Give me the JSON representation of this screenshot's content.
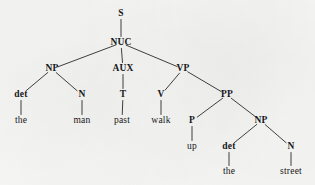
{
  "diagram": {
    "type": "constituency-syntax-tree",
    "sentence": "the man past walk up the street",
    "background_color": "#f6f6f4",
    "ink_color": "#16161a",
    "nodes": [
      {
        "id": "S",
        "label": "S",
        "kind": "category",
        "x": 121,
        "y": 14
      },
      {
        "id": "NUC",
        "label": "NUC",
        "kind": "category",
        "x": 121,
        "y": 43
      },
      {
        "id": "NP1",
        "label": "NP",
        "kind": "category",
        "x": 52,
        "y": 69
      },
      {
        "id": "AUX",
        "label": "AUX",
        "kind": "category",
        "x": 123,
        "y": 69
      },
      {
        "id": "VP",
        "label": "VP",
        "kind": "category",
        "x": 183,
        "y": 69
      },
      {
        "id": "det1",
        "label": "det",
        "kind": "category",
        "x": 21,
        "y": 95
      },
      {
        "id": "N1",
        "label": "N",
        "kind": "category",
        "x": 82,
        "y": 95
      },
      {
        "id": "T",
        "label": "T",
        "kind": "category",
        "x": 123,
        "y": 95
      },
      {
        "id": "V",
        "label": "V",
        "kind": "category",
        "x": 161,
        "y": 95
      },
      {
        "id": "PP",
        "label": "PP",
        "kind": "category",
        "x": 227,
        "y": 95
      },
      {
        "id": "the1",
        "label": "the",
        "kind": "word",
        "x": 21,
        "y": 121
      },
      {
        "id": "man",
        "label": "man",
        "kind": "word",
        "x": 82,
        "y": 121
      },
      {
        "id": "past",
        "label": "past",
        "kind": "word",
        "x": 122,
        "y": 121
      },
      {
        "id": "walk",
        "label": "walk",
        "kind": "word",
        "x": 161,
        "y": 121
      },
      {
        "id": "P",
        "label": "P",
        "kind": "category",
        "x": 192,
        "y": 121
      },
      {
        "id": "NP2",
        "label": "NP",
        "kind": "category",
        "x": 261,
        "y": 121
      },
      {
        "id": "up",
        "label": "up",
        "kind": "word",
        "x": 192,
        "y": 147
      },
      {
        "id": "det2",
        "label": "det",
        "kind": "category",
        "x": 229,
        "y": 147
      },
      {
        "id": "N2",
        "label": "N",
        "kind": "category",
        "x": 291,
        "y": 147
      },
      {
        "id": "the2",
        "label": "the",
        "kind": "word",
        "x": 229,
        "y": 172
      },
      {
        "id": "street",
        "label": "street",
        "kind": "word",
        "x": 291,
        "y": 172
      }
    ],
    "edges": [
      {
        "from": "S",
        "to": "NUC"
      },
      {
        "from": "NUC",
        "to": "NP1"
      },
      {
        "from": "NUC",
        "to": "AUX"
      },
      {
        "from": "NUC",
        "to": "VP"
      },
      {
        "from": "NP1",
        "to": "det1"
      },
      {
        "from": "NP1",
        "to": "N1"
      },
      {
        "from": "AUX",
        "to": "T"
      },
      {
        "from": "VP",
        "to": "V"
      },
      {
        "from": "VP",
        "to": "PP"
      },
      {
        "from": "det1",
        "to": "the1"
      },
      {
        "from": "N1",
        "to": "man"
      },
      {
        "from": "T",
        "to": "past"
      },
      {
        "from": "V",
        "to": "walk"
      },
      {
        "from": "PP",
        "to": "P"
      },
      {
        "from": "PP",
        "to": "NP2"
      },
      {
        "from": "P",
        "to": "up"
      },
      {
        "from": "NP2",
        "to": "det2"
      },
      {
        "from": "NP2",
        "to": "N2"
      },
      {
        "from": "det2",
        "to": "the2"
      },
      {
        "from": "N2",
        "to": "street"
      }
    ]
  }
}
